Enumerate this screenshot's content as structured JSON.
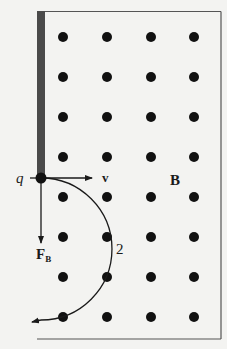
{
  "diagram": {
    "labels": {
      "charge": "q",
      "velocity": "v",
      "field": "B",
      "force_main": "F",
      "force_sub": "B",
      "path": "2"
    },
    "field_region": {
      "dot_columns_x": [
        63,
        107,
        151,
        194
      ],
      "dot_rows_y": [
        37,
        77,
        117,
        157,
        197,
        237,
        277,
        317
      ],
      "dot_radius": 5,
      "field_direction": "out of page (dots)"
    },
    "colors": {
      "ink": "#1a1a1a",
      "barrier": "#4a4a4a",
      "background": "#f3f3f1",
      "border": "#555555"
    }
  }
}
